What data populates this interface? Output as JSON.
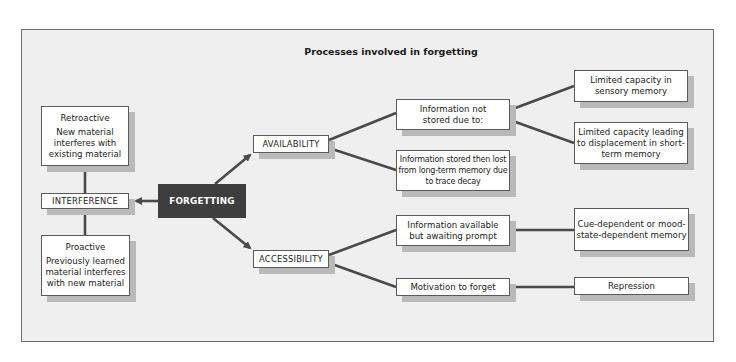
{
  "diagram": {
    "title": "Processes involved in forgetting",
    "root": {
      "label": "FORGETTING"
    },
    "interference": {
      "label": "INTERFERENCE",
      "retroactive": {
        "heading": "Retroactive",
        "text": "New material interferes with existing material"
      },
      "proactive": {
        "heading": "Proactive",
        "text": "Previously learned material interferes with new material"
      }
    },
    "availability": {
      "label": "AVAILABILITY",
      "not_stored": {
        "label": "Information not stored due to:",
        "children": [
          "Limited capacity in sensory memory",
          "Limited capacity leading to displacement in short-term memory"
        ]
      },
      "stored_lost": {
        "label": "Information stored then lost from long-term memory due to trace decay"
      }
    },
    "accessibility": {
      "label": "ACCESSIBILITY",
      "awaiting_prompt": {
        "label": "Information available but awaiting prompt",
        "child": "Cue-dependent or mood-state-dependent memory"
      },
      "motivation": {
        "label": "Motivation to forget",
        "child": "Repression"
      }
    },
    "colors": {
      "panel_bg": "#efefef",
      "panel_border": "#6e6e6e",
      "box_bg": "#ffffff",
      "box_shadow": "#b9b9b9",
      "root_bg": "#3e3e3e",
      "connector": "#4a4a4a"
    }
  }
}
